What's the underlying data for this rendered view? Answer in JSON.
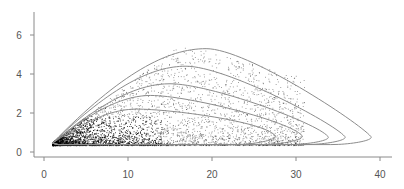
{
  "chart_data": {
    "type": "scatter",
    "title": "",
    "xlabel": "",
    "ylabel": "",
    "xlim": [
      -1,
      42
    ],
    "ylim": [
      -0.2,
      7.2
    ],
    "grid": false,
    "legend": null,
    "x_ticks": [
      0,
      10,
      20,
      30,
      40
    ],
    "y_ticks": [
      0,
      2,
      4,
      6
    ],
    "x_tick_labels": [
      "0",
      "10",
      "20",
      "30",
      "40"
    ],
    "y_tick_labels": [
      "0",
      "2",
      "4",
      "6"
    ],
    "scatter": {
      "description": "Dense point cloud concentrated near x 1-15, y 0.3-2, with sparse scattered points extending up to x~35, y~5",
      "color": "#000000",
      "density_core": {
        "x_range": [
          1,
          15
        ],
        "y_range": [
          0.3,
          2.0
        ]
      },
      "extent": {
        "x_range": [
          1,
          36
        ],
        "y_range": [
          0.3,
          5.0
        ]
      }
    },
    "contours": [
      {
        "level": 1,
        "peak": {
          "x": 19.3,
          "y": 5.3
        },
        "right_tip": {
          "x": 38.9,
          "y": 0.8
        }
      },
      {
        "level": 2,
        "peak": {
          "x": 16.9,
          "y": 4.4
        },
        "right_tip": {
          "x": 35.8,
          "y": 0.8
        }
      },
      {
        "level": 3,
        "peak": {
          "x": 15.0,
          "y": 3.5
        },
        "right_tip": {
          "x": 33.8,
          "y": 0.8
        }
      },
      {
        "level": 4,
        "peak": {
          "x": 12.7,
          "y": 2.9
        },
        "right_tip": {
          "x": 30.7,
          "y": 0.85
        }
      },
      {
        "level": 5,
        "peak": {
          "x": 11.0,
          "y": 2.2
        },
        "right_tip": {
          "x": 27.5,
          "y": 0.85
        }
      }
    ],
    "contour_color": "#8c8c8c"
  }
}
